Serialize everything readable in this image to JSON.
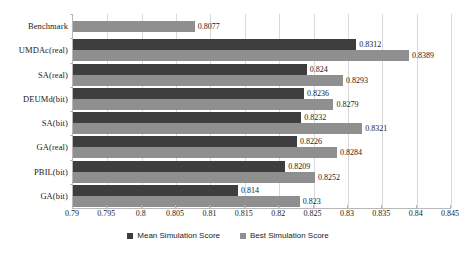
{
  "chart_data": {
    "type": "bar",
    "orientation": "horizontal",
    "title": "",
    "subtitle": "",
    "xlabel": "",
    "ylabel": "",
    "xlim": [
      0.79,
      0.845
    ],
    "xtick_step": 0.005,
    "xticks": [
      "0.79",
      "0.795",
      "0.8",
      "0.805",
      "0.81",
      "0.815",
      "0.82",
      "0.825",
      "0.83",
      "0.835",
      "0.84",
      "0.845"
    ],
    "grid": true,
    "grid_axis": "x",
    "legend_position": "bottom",
    "categories": [
      "Benchmark",
      "UMDAc(real)",
      "SA(real)",
      "DEUMd(bit)",
      "SA(bit)",
      "GA(real)",
      "PBIL(bit)",
      "GA(bit)"
    ],
    "series": [
      {
        "name": "Mean Simulation Score",
        "color": "#3e3e3e",
        "values": [
          null,
          0.8312,
          0.824,
          0.8236,
          0.8232,
          0.8226,
          0.8209,
          0.814
        ],
        "labels": [
          "",
          "0.8312",
          "0.824",
          "0.8236",
          "0.8232",
          "0.8226",
          "0.8209",
          "0.814"
        ]
      },
      {
        "name": "Best Simulation Score",
        "color": "#8f8f8f",
        "values": [
          0.8077,
          0.8389,
          0.8293,
          0.8279,
          0.8321,
          0.8284,
          0.8252,
          0.823
        ],
        "labels": [
          "0.8077",
          "0.8389",
          "0.8293",
          "0.8279",
          "0.8321",
          "0.8284",
          "0.8252",
          "0.823"
        ]
      }
    ]
  },
  "legend": {
    "items": [
      {
        "label": "Mean Simulation Score",
        "color": "#3e3e3e"
      },
      {
        "label": "Best Simulation Score",
        "color": "#8f8f8f"
      }
    ]
  }
}
